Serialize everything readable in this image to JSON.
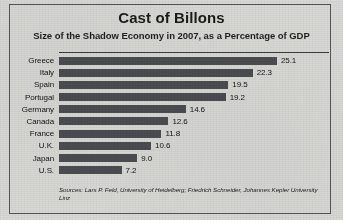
{
  "chart_data": {
    "type": "bar",
    "orientation": "horizontal",
    "title": "Cast of Billons",
    "subtitle": "Size of the Shadow Economy in 2007, as a Percentage of GDP",
    "xlabel": "",
    "ylabel": "",
    "grid": false,
    "legend": false,
    "value_labels": true,
    "xlim": [
      0,
      25.1
    ],
    "categories": [
      "Greece",
      "Italy",
      "Spain",
      "Portugal",
      "Germany",
      "Canada",
      "France",
      "U.K.",
      "Japan",
      "U.S."
    ],
    "values": [
      25.1,
      22.3,
      19.5,
      19.2,
      14.6,
      12.6,
      11.8,
      10.6,
      9.0,
      7.2
    ],
    "value_text": [
      "25.1",
      "22.3",
      "19.5",
      "19.2",
      "14.6",
      "12.6",
      "11.8",
      "10.6",
      "9.0",
      "7.2"
    ],
    "bar_color": "#4c4d50",
    "background_color": "#d8d8d5",
    "source": "Sources: Lars P. Feld, University of Heidelberg; Friedrich Schneider, Johannes Kepler University Linz"
  }
}
